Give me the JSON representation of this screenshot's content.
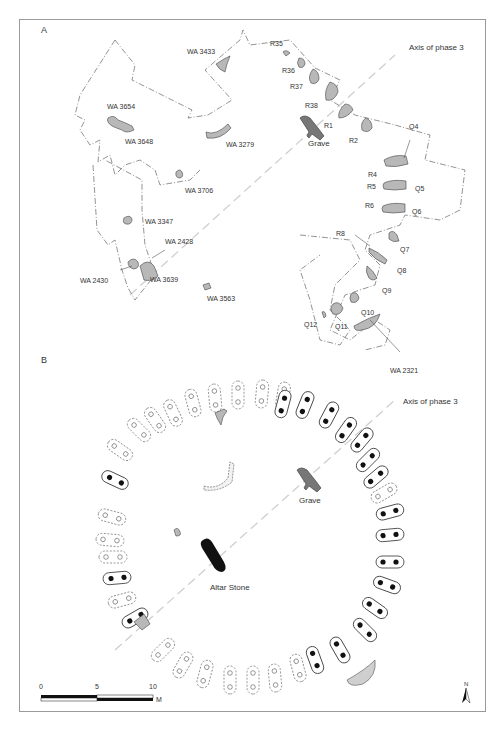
{
  "figure": {
    "panels": [
      {
        "id": "A",
        "label": "A",
        "axis_label": "Axis of phase 3",
        "features": [
          {
            "label": "WA 3433"
          },
          {
            "label": "WA 3654"
          },
          {
            "label": "WA 3648"
          },
          {
            "label": "WA 3279"
          },
          {
            "label": "WA 3706"
          },
          {
            "label": "WA 3347"
          },
          {
            "label": "WA 2428"
          },
          {
            "label": "WA 2430"
          },
          {
            "label": "WA 3639"
          },
          {
            "label": "WA 3563"
          },
          {
            "label": "WA 2321"
          },
          {
            "label": "R35"
          },
          {
            "label": "R36"
          },
          {
            "label": "R37"
          },
          {
            "label": "R38"
          },
          {
            "label": "R1"
          },
          {
            "label": "R2"
          },
          {
            "label": "Grave"
          },
          {
            "label": "Q4"
          },
          {
            "label": "R4"
          },
          {
            "label": "R5"
          },
          {
            "label": "Q5"
          },
          {
            "label": "R6"
          },
          {
            "label": "Q6"
          },
          {
            "label": "Q7"
          },
          {
            "label": "R8"
          },
          {
            "label": "Q8"
          },
          {
            "label": "Q9"
          },
          {
            "label": "Q10"
          },
          {
            "label": "Q11"
          },
          {
            "label": "Q12"
          }
        ]
      },
      {
        "id": "B",
        "label": "B",
        "axis_label": "Axis of phase 3",
        "features": [
          {
            "label": "Grave"
          },
          {
            "label": "Altar Stone"
          }
        ]
      }
    ],
    "scale_bar": {
      "ticks": [
        "0",
        "5",
        "10"
      ],
      "unit": "M"
    },
    "north_arrow": {
      "label": "N"
    },
    "colors": {
      "frame": "#9a9a9a",
      "stone_fill": "#b8b8b8",
      "grave_fill": "#777777",
      "altar_fill": "#111111",
      "axis_line": "#cfcfcf",
      "outline": "#444444"
    }
  }
}
